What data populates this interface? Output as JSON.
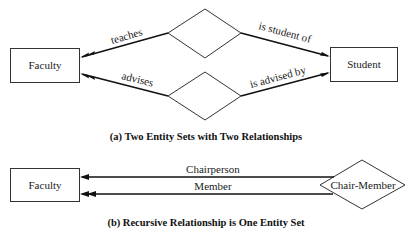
{
  "figure_a": {
    "caption": "(a) Two Entity Sets with Two Relationships",
    "entities": [
      {
        "id": "faculty",
        "label": "Faculty"
      },
      {
        "id": "student",
        "label": "Student"
      }
    ],
    "relationships": [
      {
        "id": "rel-1",
        "left_role": "teaches",
        "right_role": "is student of"
      },
      {
        "id": "rel-2",
        "left_role": "advises",
        "right_role": "is advised by"
      }
    ]
  },
  "figure_b": {
    "caption": "(b) Recursive Relationship is One Entity Set",
    "entity": {
      "id": "faculty",
      "label": "Faculty"
    },
    "relationship": {
      "id": "chair-member",
      "label": "Chair-Member"
    },
    "roles": [
      {
        "label": "Chairperson",
        "cardinality": "one"
      },
      {
        "label": "Member",
        "cardinality": "many"
      }
    ]
  }
}
